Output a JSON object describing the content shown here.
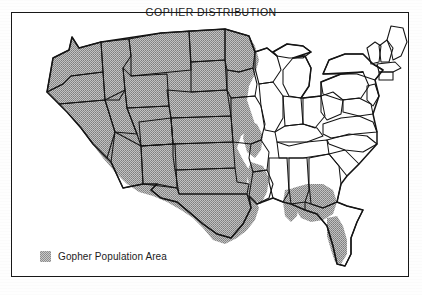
{
  "figure": {
    "title": "GOPHER DISTRIBUTION",
    "type": "thematic-map",
    "region": "Contiguous United States",
    "style": "black-and-white scanned line map with halftone shading"
  },
  "legend": {
    "swatch_name": "gray-halftone-swatch",
    "label": "Gopher Population Area",
    "swatch_color": "#9a9a9a"
  },
  "colors": {
    "background": "#ffffff",
    "border": "#141414",
    "shading": "#9a9a9a",
    "text": "#1a1a1a"
  },
  "map_data": {
    "shaded_states": [
      "Washington",
      "Oregon",
      "California",
      "Nevada",
      "Idaho",
      "Montana",
      "Wyoming",
      "Utah",
      "Colorado",
      "Arizona",
      "New Mexico",
      "North Dakota",
      "South Dakota",
      "Nebraska",
      "Kansas",
      "Oklahoma",
      "Texas",
      "Missouri",
      "Iowa",
      "Minnesota",
      "Arkansas",
      "Louisiana",
      "Alabama",
      "Georgia",
      "Florida"
    ],
    "unshaded_states": [
      "Wisconsin",
      "Illinois",
      "Michigan",
      "Indiana",
      "Ohio",
      "Kentucky",
      "Tennessee",
      "Mississippi",
      "West Virginia",
      "Virginia",
      "North Carolina",
      "South Carolina",
      "Pennsylvania",
      "New York",
      "Maine",
      "Vermont",
      "New Hampshire",
      "Massachusetts",
      "Rhode Island",
      "Connecticut",
      "New Jersey",
      "Delaware",
      "Maryland"
    ],
    "partial_states": [
      "Minnesota",
      "Iowa",
      "Illinois",
      "Colorado",
      "Texas",
      "Alabama",
      "Georgia",
      "Florida",
      "Louisiana",
      "Arkansas"
    ],
    "notes": "Shading covers the western and plains states continuously, tapering diagonally across Minnesota and Iowa, with a separate southeastern population across Alabama, Georgia and the Florida peninsula."
  }
}
